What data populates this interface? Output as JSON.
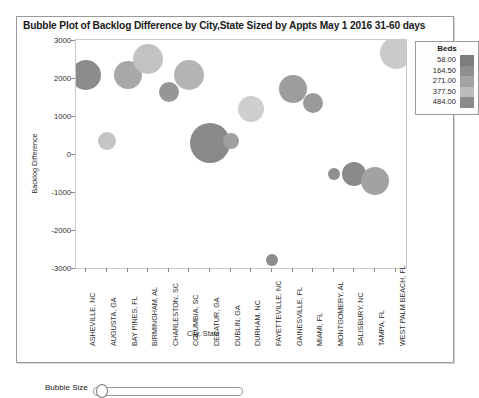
{
  "panel": {
    "title": "Bubble Plot of Backlog Difference by City,State Sized by Appts May 1 2016 31-60 days"
  },
  "controls": {
    "bubble_size_label": "Bubble Size",
    "bubble_size_value": 8
  },
  "legend": {
    "title": "Beds",
    "entries": [
      {
        "value": "58.00",
        "color": "#7d7d7d"
      },
      {
        "value": "164.50",
        "color": "#8f8f8f"
      },
      {
        "value": "271.00",
        "color": "#a3a3a3"
      },
      {
        "value": "377.50",
        "color": "#bcbcbc"
      },
      {
        "value": "484.00",
        "color": "#8a8a8a"
      }
    ]
  },
  "chart_data": {
    "type": "scatter",
    "title": "Bubble Plot of Backlog Difference by City,State Sized by Appts May 1 2016 31-60 days",
    "xlabel": "City, State",
    "ylabel": "Backlog Difference",
    "ylim": [
      -3000,
      3000
    ],
    "yticks": [
      "3000",
      "2000",
      "1000",
      "0",
      "-1000",
      "-2000",
      "-3000"
    ],
    "grid": false,
    "legend": {
      "title": "Beds",
      "position": "right"
    },
    "size_encoding": "Appts",
    "color_encoding": "Beds",
    "categories": [
      "ASHEVILLE, NC",
      "AUGUSTA, GA",
      "BAY PINES, FL",
      "BIRMINGHAM, AL",
      "CHARLESTON, SC",
      "COLUMBIA, SC",
      "DECATUR, GA",
      "DUBLIN, GA",
      "DURHAM, NC",
      "FAYETTEVILLE, NC",
      "GAINESVILLE, FL",
      "MIAMI, FL",
      "MONTGOMERY, AL",
      "SALISBURY, NC",
      "WEST PALM BEACH, FL"
    ],
    "points": [
      {
        "category": "ASHEVILLE, NC",
        "y": 2080,
        "size": 15,
        "color": "#8c8c8c"
      },
      {
        "category": "AUGUSTA, GA",
        "y": 330,
        "size": 9,
        "color": "#c4c4c4"
      },
      {
        "category": "BAY PINES, FL",
        "y": 2080,
        "size": 14,
        "color": "#a8a8a8"
      },
      {
        "category": "BIRMINGHAM, AL",
        "y": 2500,
        "size": 15,
        "color": "#c2c2c2"
      },
      {
        "category": "CHARLESTON, SC",
        "y": 1620,
        "size": 10,
        "color": "#969696"
      },
      {
        "category": "COLUMBIA, SC",
        "y": 2090,
        "size": 15,
        "color": "#b4b4b4"
      },
      {
        "category": "DECATUR, GA",
        "y": 300,
        "size": 20,
        "color": "#8a8a8a"
      },
      {
        "category": "DUBLIN, GA",
        "y": 340,
        "size": 8,
        "color": "#a0a0a0"
      },
      {
        "category": "DURHAM, NC",
        "y": 1180,
        "size": 13,
        "color": "#cfcfcf"
      },
      {
        "category": "FAYETTEVILLE, NC",
        "y": -2800,
        "size": 6,
        "color": "#8c8c8c"
      },
      {
        "category": "GAINESVILLE, FL",
        "y": 1700,
        "size": 14,
        "color": "#9d9d9d"
      },
      {
        "category": "MIAMI, FL",
        "y": 1350,
        "size": 10,
        "color": "#9a9a9a"
      },
      {
        "category": "MONTGOMERY, AL",
        "y": -520,
        "size": 6,
        "color": "#8f8f8f"
      },
      {
        "category": "SALISBURY, NC",
        "y": -520,
        "size": 12,
        "color": "#8a8a8a"
      },
      {
        "category": "TAMPA, FL",
        "y": -700,
        "size": 14,
        "color": "#a2a2a2"
      },
      {
        "category": "WEST PALM BEACH, FL",
        "y": 2650,
        "size": 16,
        "color": "#cacaca"
      }
    ],
    "xtick_labels": [
      "ASHEVILLE, NC",
      "AUGUSTA, GA",
      "BAY PINES, FL",
      "BIRMINGHAM, AL",
      "CHARLESTON, SC",
      "COLUMBIA, SC",
      "DECATUR, GA",
      "DUBLIN, GA",
      "DURHAM, NC",
      "FAYETTEVILLE, NC",
      "GAINESVILLE, FL",
      "MIAMI, FL",
      "MONTGOMERY, AL",
      "SALISBURY, NC",
      "TAMPA, FL",
      "WEST PALM BEACH, FL"
    ]
  }
}
